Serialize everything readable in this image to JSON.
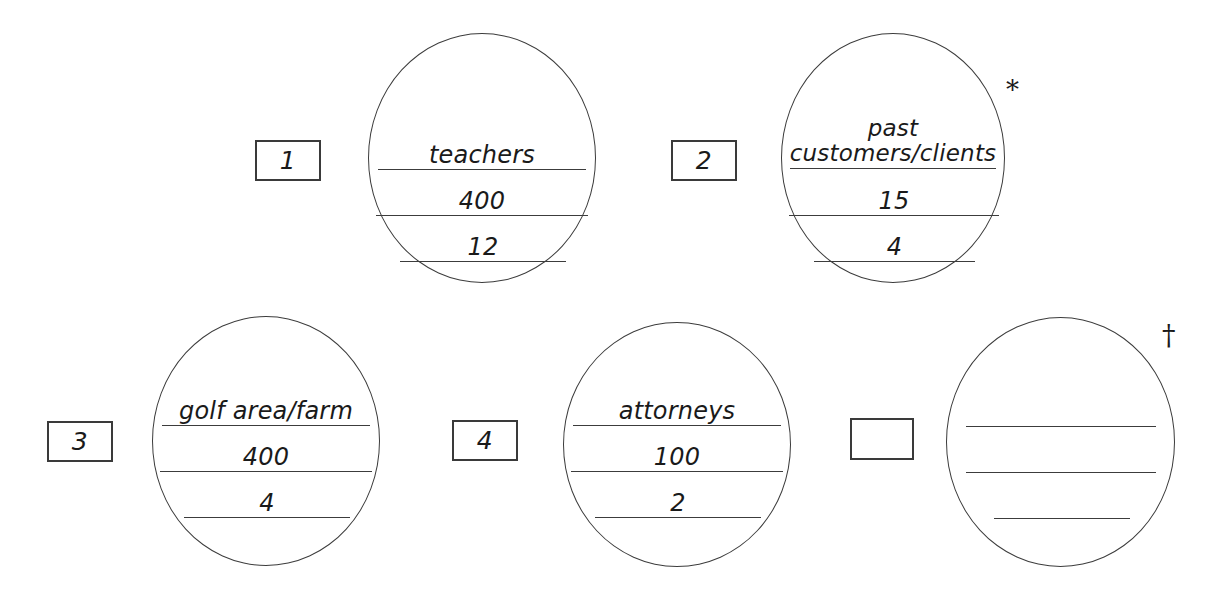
{
  "worksheet": {
    "title": "fill-in circles worksheet",
    "background_color": "#ffffff",
    "ink_color": "#3c3c3c"
  },
  "items": [
    {
      "id": "item-1",
      "box_label": "1",
      "marker": "",
      "lines": [
        {
          "slot": "top",
          "value": "teachers"
        },
        {
          "slot": "middle",
          "value": "400"
        },
        {
          "slot": "bottom",
          "value": "12"
        }
      ]
    },
    {
      "id": "item-2",
      "box_label": "2",
      "marker": "*",
      "lines": [
        {
          "slot": "top",
          "value": "past customers/clients"
        },
        {
          "slot": "middle",
          "value": "15"
        },
        {
          "slot": "bottom",
          "value": "4"
        }
      ]
    },
    {
      "id": "item-3",
      "box_label": "3",
      "marker": "",
      "lines": [
        {
          "slot": "top",
          "value": "golf area/farm"
        },
        {
          "slot": "middle",
          "value": "400"
        },
        {
          "slot": "bottom",
          "value": "4"
        }
      ]
    },
    {
      "id": "item-4",
      "box_label": "4",
      "marker": "",
      "lines": [
        {
          "slot": "top",
          "value": "attorneys"
        },
        {
          "slot": "middle",
          "value": "100"
        },
        {
          "slot": "bottom",
          "value": "2"
        }
      ]
    },
    {
      "id": "item-5",
      "box_label": "",
      "marker": "†",
      "lines": [
        {
          "slot": "top",
          "value": ""
        },
        {
          "slot": "middle",
          "value": ""
        },
        {
          "slot": "bottom",
          "value": ""
        }
      ]
    }
  ]
}
